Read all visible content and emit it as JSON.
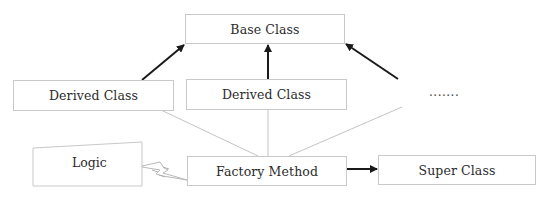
{
  "diagram": {
    "colors": {
      "box_border": "#c9c9c9",
      "arrow": "#1a1a1a",
      "connector": "#c4c4c4",
      "text": "#2b2b2b"
    },
    "nodes": {
      "base_class": {
        "label": "Base Class"
      },
      "derived_class_1": {
        "label": "Derived Class"
      },
      "derived_class_2": {
        "label": "Derived Class"
      },
      "derived_more": {
        "label": "......."
      },
      "logic": {
        "label": "Logic"
      },
      "factory_method": {
        "label": "Factory Method"
      },
      "super_class": {
        "label": "Super Class"
      }
    },
    "edges": [
      {
        "from": "derived_class_1",
        "to": "base_class",
        "style": "arrow"
      },
      {
        "from": "derived_class_2",
        "to": "base_class",
        "style": "arrow"
      },
      {
        "from": "derived_more",
        "to": "base_class",
        "style": "arrow"
      },
      {
        "from": "derived_class_1",
        "to": "factory_method",
        "style": "line"
      },
      {
        "from": "derived_class_2",
        "to": "factory_method",
        "style": "line"
      },
      {
        "from": "derived_more",
        "to": "factory_method",
        "style": "line"
      },
      {
        "from": "logic",
        "to": "factory_method",
        "style": "lightning"
      },
      {
        "from": "factory_method",
        "to": "super_class",
        "style": "arrow"
      }
    ]
  }
}
